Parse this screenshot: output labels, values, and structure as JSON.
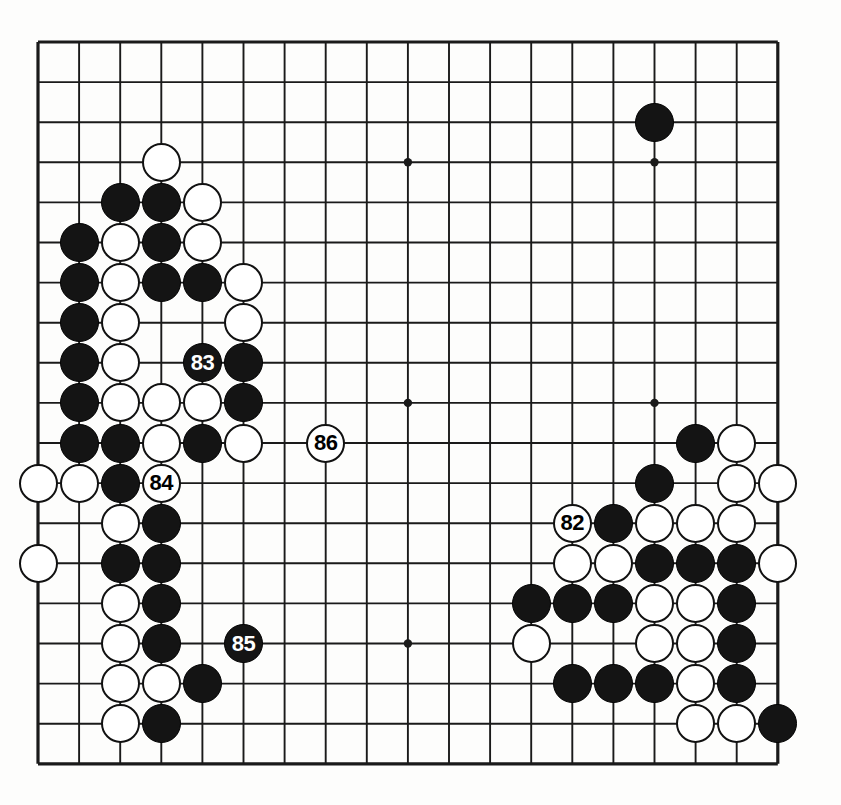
{
  "diagram": {
    "type": "go-board-diagram",
    "board_size": 19,
    "caption": "",
    "geometry": {
      "left": 38,
      "top": 42,
      "spacing_x": 41.1,
      "spacing_y": 40.1,
      "stone_radius": 19.5,
      "line_color": "#1a1a1a",
      "board_color": "#fdfdfc",
      "black_color": "#141414",
      "white_color": "#ffffff",
      "outer_line_width": 3.2,
      "inner_line_width": 1.9
    },
    "star_points": [
      {
        "col": 3,
        "row": 3
      },
      {
        "col": 9,
        "row": 3
      },
      {
        "col": 15,
        "row": 3
      },
      {
        "col": 3,
        "row": 9
      },
      {
        "col": 9,
        "row": 9
      },
      {
        "col": 15,
        "row": 9
      },
      {
        "col": 3,
        "row": 15
      },
      {
        "col": 9,
        "row": 15
      },
      {
        "col": 15,
        "row": 15
      }
    ],
    "stones": [
      {
        "col": 15,
        "row": 2,
        "color": "black",
        "label": ""
      },
      {
        "col": 3,
        "row": 3,
        "color": "white",
        "label": ""
      },
      {
        "col": 2,
        "row": 4,
        "color": "black",
        "label": ""
      },
      {
        "col": 3,
        "row": 4,
        "color": "black",
        "label": ""
      },
      {
        "col": 4,
        "row": 4,
        "color": "white",
        "label": ""
      },
      {
        "col": 1,
        "row": 5,
        "color": "black",
        "label": ""
      },
      {
        "col": 2,
        "row": 5,
        "color": "white",
        "label": ""
      },
      {
        "col": 3,
        "row": 5,
        "color": "black",
        "label": ""
      },
      {
        "col": 4,
        "row": 5,
        "color": "white",
        "label": ""
      },
      {
        "col": 1,
        "row": 6,
        "color": "black",
        "label": ""
      },
      {
        "col": 2,
        "row": 6,
        "color": "white",
        "label": ""
      },
      {
        "col": 3,
        "row": 6,
        "color": "black",
        "label": ""
      },
      {
        "col": 4,
        "row": 6,
        "color": "black",
        "label": ""
      },
      {
        "col": 5,
        "row": 6,
        "color": "white",
        "label": ""
      },
      {
        "col": 1,
        "row": 7,
        "color": "black",
        "label": ""
      },
      {
        "col": 2,
        "row": 7,
        "color": "white",
        "label": ""
      },
      {
        "col": 5,
        "row": 7,
        "color": "white",
        "label": ""
      },
      {
        "col": 1,
        "row": 8,
        "color": "black",
        "label": ""
      },
      {
        "col": 2,
        "row": 8,
        "color": "white",
        "label": ""
      },
      {
        "col": 4,
        "row": 8,
        "color": "black",
        "label": "83"
      },
      {
        "col": 5,
        "row": 8,
        "color": "black",
        "label": ""
      },
      {
        "col": 1,
        "row": 9,
        "color": "black",
        "label": ""
      },
      {
        "col": 2,
        "row": 9,
        "color": "white",
        "label": ""
      },
      {
        "col": 3,
        "row": 9,
        "color": "white",
        "label": ""
      },
      {
        "col": 4,
        "row": 9,
        "color": "white",
        "label": ""
      },
      {
        "col": 5,
        "row": 9,
        "color": "black",
        "label": ""
      },
      {
        "col": 1,
        "row": 10,
        "color": "black",
        "label": ""
      },
      {
        "col": 2,
        "row": 10,
        "color": "black",
        "label": ""
      },
      {
        "col": 3,
        "row": 10,
        "color": "white",
        "label": ""
      },
      {
        "col": 4,
        "row": 10,
        "color": "black",
        "label": ""
      },
      {
        "col": 5,
        "row": 10,
        "color": "white",
        "label": ""
      },
      {
        "col": 7,
        "row": 10,
        "color": "white",
        "label": "86"
      },
      {
        "col": 16,
        "row": 10,
        "color": "black",
        "label": ""
      },
      {
        "col": 17,
        "row": 10,
        "color": "white",
        "label": ""
      },
      {
        "col": 0,
        "row": 11,
        "color": "white",
        "label": ""
      },
      {
        "col": 1,
        "row": 11,
        "color": "white",
        "label": ""
      },
      {
        "col": 2,
        "row": 11,
        "color": "black",
        "label": ""
      },
      {
        "col": 3,
        "row": 11,
        "color": "white",
        "label": "84"
      },
      {
        "col": 15,
        "row": 11,
        "color": "black",
        "label": ""
      },
      {
        "col": 17,
        "row": 11,
        "color": "white",
        "label": ""
      },
      {
        "col": 18,
        "row": 11,
        "color": "white",
        "label": ""
      },
      {
        "col": 2,
        "row": 12,
        "color": "white",
        "label": ""
      },
      {
        "col": 3,
        "row": 12,
        "color": "black",
        "label": ""
      },
      {
        "col": 13,
        "row": 12,
        "color": "white",
        "label": "82"
      },
      {
        "col": 14,
        "row": 12,
        "color": "black",
        "label": ""
      },
      {
        "col": 15,
        "row": 12,
        "color": "white",
        "label": ""
      },
      {
        "col": 16,
        "row": 12,
        "color": "white",
        "label": ""
      },
      {
        "col": 17,
        "row": 12,
        "color": "white",
        "label": ""
      },
      {
        "col": 0,
        "row": 13,
        "color": "white",
        "label": ""
      },
      {
        "col": 2,
        "row": 13,
        "color": "black",
        "label": ""
      },
      {
        "col": 3,
        "row": 13,
        "color": "black",
        "label": ""
      },
      {
        "col": 13,
        "row": 13,
        "color": "white",
        "label": ""
      },
      {
        "col": 14,
        "row": 13,
        "color": "white",
        "label": ""
      },
      {
        "col": 15,
        "row": 13,
        "color": "black",
        "label": ""
      },
      {
        "col": 16,
        "row": 13,
        "color": "black",
        "label": ""
      },
      {
        "col": 17,
        "row": 13,
        "color": "black",
        "label": ""
      },
      {
        "col": 18,
        "row": 13,
        "color": "white",
        "label": ""
      },
      {
        "col": 2,
        "row": 14,
        "color": "white",
        "label": ""
      },
      {
        "col": 3,
        "row": 14,
        "color": "black",
        "label": ""
      },
      {
        "col": 12,
        "row": 14,
        "color": "black",
        "label": ""
      },
      {
        "col": 13,
        "row": 14,
        "color": "black",
        "label": ""
      },
      {
        "col": 14,
        "row": 14,
        "color": "black",
        "label": ""
      },
      {
        "col": 15,
        "row": 14,
        "color": "white",
        "label": ""
      },
      {
        "col": 16,
        "row": 14,
        "color": "white",
        "label": ""
      },
      {
        "col": 17,
        "row": 14,
        "color": "black",
        "label": ""
      },
      {
        "col": 2,
        "row": 15,
        "color": "white",
        "label": ""
      },
      {
        "col": 3,
        "row": 15,
        "color": "black",
        "label": ""
      },
      {
        "col": 5,
        "row": 15,
        "color": "black",
        "label": "85"
      },
      {
        "col": 12,
        "row": 15,
        "color": "white",
        "label": ""
      },
      {
        "col": 15,
        "row": 15,
        "color": "white",
        "label": ""
      },
      {
        "col": 16,
        "row": 15,
        "color": "white",
        "label": ""
      },
      {
        "col": 17,
        "row": 15,
        "color": "black",
        "label": ""
      },
      {
        "col": 2,
        "row": 16,
        "color": "white",
        "label": ""
      },
      {
        "col": 3,
        "row": 16,
        "color": "white",
        "label": ""
      },
      {
        "col": 4,
        "row": 16,
        "color": "black",
        "label": ""
      },
      {
        "col": 13,
        "row": 16,
        "color": "black",
        "label": ""
      },
      {
        "col": 14,
        "row": 16,
        "color": "black",
        "label": ""
      },
      {
        "col": 15,
        "row": 16,
        "color": "black",
        "label": ""
      },
      {
        "col": 16,
        "row": 16,
        "color": "white",
        "label": ""
      },
      {
        "col": 17,
        "row": 16,
        "color": "black",
        "label": ""
      },
      {
        "col": 2,
        "row": 17,
        "color": "white",
        "label": ""
      },
      {
        "col": 3,
        "row": 17,
        "color": "black",
        "label": ""
      },
      {
        "col": 16,
        "row": 17,
        "color": "white",
        "label": ""
      },
      {
        "col": 17,
        "row": 17,
        "color": "white",
        "label": ""
      },
      {
        "col": 18,
        "row": 17,
        "color": "black",
        "label": ""
      }
    ],
    "move_labels": [
      "82",
      "83",
      "84",
      "85",
      "86"
    ]
  }
}
